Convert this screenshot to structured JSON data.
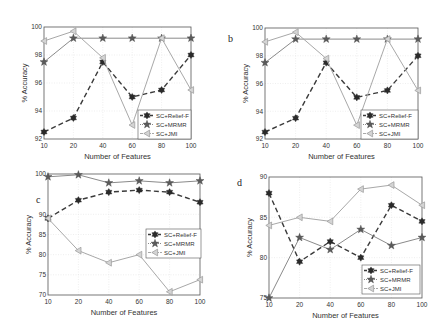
{
  "chart_data": [
    {
      "panel": "a",
      "type": "line",
      "title": "",
      "xlabel": "Number of Features",
      "ylabel": "% Accuracy",
      "x": [
        10,
        20,
        40,
        60,
        80,
        100
      ],
      "xticks": [
        "10",
        "20",
        "40",
        "60",
        "80",
        "100"
      ],
      "ylim": [
        92,
        100
      ],
      "yticks": [
        92,
        94,
        96,
        98,
        100
      ],
      "legend_position": "lower right",
      "grid": true,
      "series": [
        {
          "name": "SC+Relief-F",
          "values": [
            92.5,
            93.5,
            97.5,
            95.0,
            95.5,
            98.0
          ]
        },
        {
          "name": "SC+MRMR",
          "values": [
            97.5,
            99.2,
            99.2,
            99.2,
            99.2,
            99.2
          ]
        },
        {
          "name": "SC+JMI",
          "values": [
            99.0,
            99.7,
            97.8,
            93.0,
            99.2,
            95.5
          ]
        }
      ]
    },
    {
      "panel": "b",
      "type": "line",
      "title": "",
      "xlabel": "Number of Features",
      "ylabel": "% Accuracy",
      "x": [
        10,
        20,
        40,
        60,
        80,
        100
      ],
      "xticks": [
        "10",
        "20",
        "40",
        "60",
        "80",
        "100"
      ],
      "ylim": [
        92,
        100
      ],
      "yticks": [
        92,
        94,
        96,
        98,
        100
      ],
      "legend_position": "lower right",
      "grid": true,
      "series": [
        {
          "name": "SC+Relief-F",
          "values": [
            92.5,
            93.5,
            97.5,
            95.0,
            95.5,
            98.0
          ]
        },
        {
          "name": "SC+MRMR",
          "values": [
            97.5,
            99.2,
            99.2,
            99.2,
            99.2,
            99.2
          ]
        },
        {
          "name": "SC+JMI",
          "values": [
            99.0,
            99.7,
            97.8,
            93.0,
            99.2,
            95.5
          ]
        }
      ]
    },
    {
      "panel": "c",
      "type": "line",
      "title": "",
      "xlabel": "Number of Features",
      "ylabel": "% Accuracy",
      "x": [
        10,
        20,
        40,
        60,
        80,
        100
      ],
      "xticks": [
        "10",
        "20",
        "40",
        "60",
        "80",
        "100"
      ],
      "ylim": [
        70,
        100
      ],
      "yticks": [
        70,
        75,
        80,
        85,
        90,
        100
      ],
      "legend_position": "center right",
      "grid": true,
      "series": [
        {
          "name": "SC+Relief-F",
          "values": [
            89.0,
            93.5,
            95.5,
            96.0,
            95.5,
            93.0
          ]
        },
        {
          "name": "SC+MRMR",
          "values": [
            99.3,
            99.8,
            97.8,
            98.3,
            97.8,
            98.3
          ]
        },
        {
          "name": "SC+JMI",
          "values": [
            89.0,
            81.0,
            78.0,
            80.0,
            70.8,
            73.8
          ]
        }
      ]
    },
    {
      "panel": "d",
      "type": "line",
      "title": "",
      "xlabel": "Number of Features",
      "ylabel": "% Accuracy",
      "x": [
        10,
        20,
        40,
        60,
        80,
        100
      ],
      "xticks": [
        "10",
        "20",
        "40",
        "60",
        "80",
        "100"
      ],
      "ylim": [
        75,
        90
      ],
      "yticks": [
        75,
        80,
        85,
        90
      ],
      "legend_position": "lower right",
      "grid": true,
      "series": [
        {
          "name": "SC+Relief-F",
          "values": [
            88.0,
            79.5,
            82.0,
            80.0,
            86.5,
            84.5
          ]
        },
        {
          "name": "SC+MRMR",
          "values": [
            75.0,
            82.5,
            81.0,
            83.5,
            81.5,
            82.5
          ]
        },
        {
          "name": "SC+JMI",
          "values": [
            84.0,
            85.0,
            84.5,
            88.5,
            89.0,
            86.5
          ]
        }
      ]
    }
  ],
  "layout": [
    {
      "left": 44,
      "top": 27,
      "right": 191,
      "bottom": 139,
      "panel_label_pos": null,
      "legend": {
        "x": 138,
        "y": 110,
        "w": 53,
        "h": 29
      }
    },
    {
      "left": 265,
      "top": 28,
      "right": 418,
      "bottom": 139,
      "panel_label_pos": [
        228,
        42
      ],
      "legend": {
        "x": 361,
        "y": 110,
        "w": 57,
        "h": 29
      }
    },
    {
      "left": 48,
      "top": 174,
      "right": 200,
      "bottom": 295,
      "panel_label_pos": [
        36,
        203
      ],
      "legend": {
        "x": 146,
        "y": 229,
        "w": 55,
        "h": 29
      }
    },
    {
      "left": 269,
      "top": 177,
      "right": 422,
      "bottom": 298,
      "panel_label_pos": [
        237,
        186
      ],
      "legend": {
        "x": 362,
        "y": 265,
        "w": 58,
        "h": 29
      }
    }
  ],
  "styles": {
    "series": [
      {
        "color": "#3a3a3a",
        "dash": "5,3",
        "width": 1.4,
        "marker": "hexstar"
      },
      {
        "color": "#8a8a8a",
        "dash": "",
        "width": 1.0,
        "marker": "star",
        "mrmr_dotted": true
      },
      {
        "color": "#a8a8a8",
        "dash": "",
        "width": 1.0,
        "marker": "triangle-left"
      }
    ],
    "axis_color": "#555555",
    "grid_color": "#e4e4e4"
  }
}
